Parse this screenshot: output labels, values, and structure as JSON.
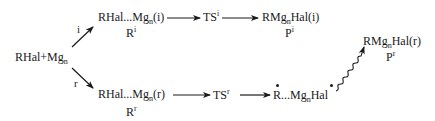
{
  "diagram": {
    "type": "reaction-scheme",
    "reactant": {
      "main": "RHal+Mg",
      "sub": "n"
    },
    "pathways": {
      "i": {
        "label": "i",
        "intermediate": {
          "pre": "RHal...Mg",
          "sub": "n",
          "post": "(i)"
        },
        "intermediate_name": {
          "base": "R",
          "sup": "i"
        },
        "transition_state": {
          "base": "TS",
          "sup": "i"
        },
        "product": {
          "pre": "RMg",
          "sub": "n",
          "post": "Hal(i)"
        },
        "product_name": {
          "base": "P",
          "sup": "i"
        }
      },
      "r": {
        "label": "r",
        "intermediate": {
          "pre": "RHal...Mg",
          "sub": "n",
          "post": "(r)"
        },
        "intermediate_name": {
          "base": "R",
          "sup": "r"
        },
        "transition_state": {
          "base": "TS",
          "sup": "r"
        },
        "radical_pair": {
          "pre": "R...Mg",
          "sub": "n",
          "post": "Hal"
        },
        "product": {
          "pre": "RMg",
          "sub": "n",
          "post": "Hal(r)"
        },
        "product_name": {
          "base": "P",
          "sup": "r"
        }
      }
    },
    "colors": {
      "ink": "#1a1a1a",
      "background": "#ffffff"
    }
  }
}
